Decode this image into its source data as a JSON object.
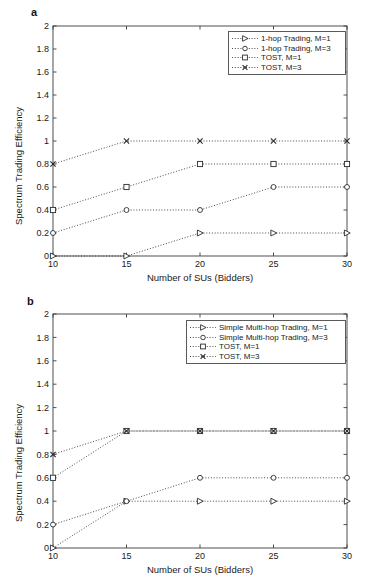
{
  "figure": {
    "background": "#ffffff",
    "axis_color": "#3c3c3c",
    "series_color": "#2b2b2b"
  },
  "panels": [
    {
      "letter": "a",
      "xlabel": "Number of SUs (Bidders)",
      "ylabel": "Spectrum Trading Efficiency",
      "xticks": [
        "10",
        "15",
        "20",
        "25",
        "30"
      ],
      "yticks": [
        "0",
        "0.2",
        "0.4",
        "0.6",
        "0.8",
        "1",
        "1.2",
        "1.4",
        "1.6",
        "1.8",
        "2"
      ],
      "legend": [
        {
          "label": "1-hop Trading, M=1",
          "marker": "triangle-right-marker"
        },
        {
          "label": "1-hop Trading, M=3",
          "marker": "circle-marker"
        },
        {
          "label": "TOST, M=1",
          "marker": "square-marker"
        },
        {
          "label": "TOST, M=3",
          "marker": "cross-marker"
        }
      ]
    },
    {
      "letter": "b",
      "xlabel": "Number of SUs (Bidders)",
      "ylabel": "Spectrum Trading Efficiency",
      "xticks": [
        "10",
        "15",
        "20",
        "25",
        "30"
      ],
      "yticks": [
        "0",
        "0.2",
        "0.4",
        "0.6",
        "0.8",
        "1",
        "1.2",
        "1.4",
        "1.6",
        "1.8",
        "2"
      ],
      "legend": [
        {
          "label": "Simple Multi-hop Trading, M=1",
          "marker": "triangle-right-marker"
        },
        {
          "label": "Simple Multi-hop Trading, M=3",
          "marker": "circle-marker"
        },
        {
          "label": "TOST, M=1",
          "marker": "square-marker"
        },
        {
          "label": "TOST, M=3",
          "marker": "cross-marker"
        }
      ]
    }
  ],
  "chart_data": [
    {
      "type": "line",
      "panel": "a",
      "title": "",
      "xlabel": "Number of SUs (Bidders)",
      "ylabel": "Spectrum Trading Efficiency",
      "x": [
        10,
        15,
        20,
        25,
        30
      ],
      "xlim": [
        10,
        30
      ],
      "ylim": [
        0,
        2
      ],
      "xticks": [
        10,
        15,
        20,
        25,
        30
      ],
      "yticks": [
        0,
        0.2,
        0.4,
        0.6,
        0.8,
        1,
        1.2,
        1.4,
        1.6,
        1.8,
        2
      ],
      "grid": false,
      "legend_position": "upper right",
      "linestyle": "dotted",
      "series": [
        {
          "name": "1-hop Trading, M=1",
          "marker": "triangle-right",
          "values": [
            0,
            0,
            0.2,
            0.2,
            0.2
          ]
        },
        {
          "name": "1-hop Trading, M=3",
          "marker": "circle",
          "values": [
            0.2,
            0.4,
            0.4,
            0.6,
            0.6
          ]
        },
        {
          "name": "TOST, M=1",
          "marker": "square",
          "values": [
            0.4,
            0.6,
            0.8,
            0.8,
            0.8
          ]
        },
        {
          "name": "TOST, M=3",
          "marker": "cross",
          "values": [
            0.8,
            1,
            1,
            1,
            1
          ]
        }
      ]
    },
    {
      "type": "line",
      "panel": "b",
      "title": "",
      "xlabel": "Number of SUs (Bidders)",
      "ylabel": "Spectrum Trading Efficiency",
      "x": [
        10,
        15,
        20,
        25,
        30
      ],
      "xlim": [
        10,
        30
      ],
      "ylim": [
        0,
        2
      ],
      "xticks": [
        10,
        15,
        20,
        25,
        30
      ],
      "yticks": [
        0,
        0.2,
        0.4,
        0.6,
        0.8,
        1,
        1.2,
        1.4,
        1.6,
        1.8,
        2
      ],
      "grid": false,
      "legend_position": "upper right",
      "linestyle": "dotted",
      "series": [
        {
          "name": "Simple Multi-hop Trading, M=1",
          "marker": "triangle-right",
          "values": [
            0,
            0.4,
            0.4,
            0.4,
            0.4
          ]
        },
        {
          "name": "Simple Multi-hop Trading, M=3",
          "marker": "circle",
          "values": [
            0.2,
            0.4,
            0.6,
            0.6,
            0.6
          ]
        },
        {
          "name": "TOST, M=1",
          "marker": "square",
          "values": [
            0.6,
            1,
            1,
            1,
            1
          ]
        },
        {
          "name": "TOST, M=3",
          "marker": "cross",
          "values": [
            0.8,
            1,
            1,
            1,
            1
          ]
        }
      ]
    }
  ]
}
